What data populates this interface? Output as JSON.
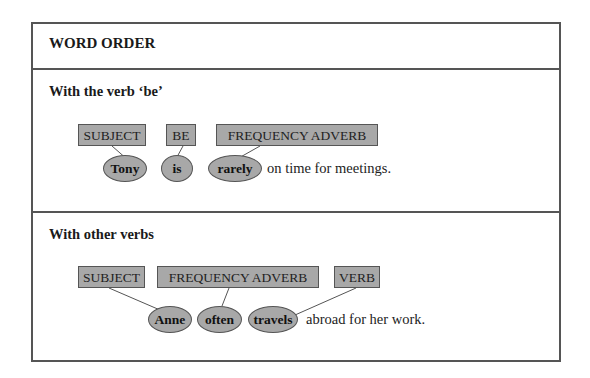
{
  "title": "WORD ORDER",
  "sections": [
    {
      "heading": "With the verb ‘be’",
      "labels": [
        "SUBJECT",
        "BE",
        "FREQUENCY ADVERB"
      ],
      "words": [
        "Tony",
        "is",
        "rarely"
      ],
      "rest": "on time for meetings."
    },
    {
      "heading": "With other verbs",
      "labels": [
        "SUBJECT",
        "FREQUENCY ADVERB",
        "VERB"
      ],
      "words": [
        "Anne",
        "often",
        "travels"
      ],
      "rest": "abroad for her work."
    }
  ],
  "colors": {
    "box_fill": "#a8a8a8",
    "border": "#555555"
  }
}
